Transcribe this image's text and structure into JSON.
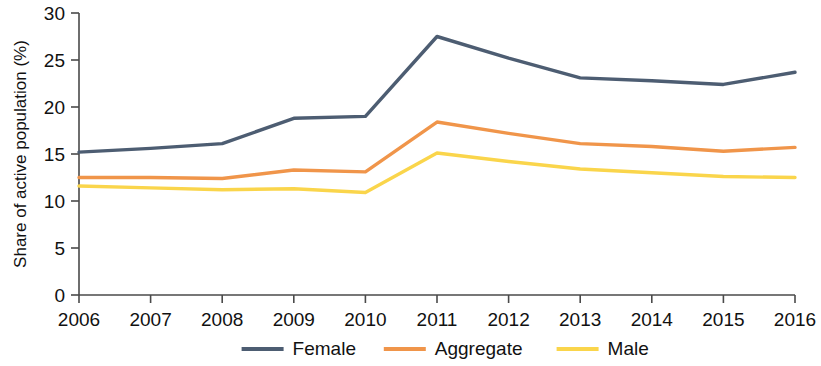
{
  "chart_data": {
    "type": "line",
    "title": "",
    "xlabel": "",
    "ylabel": "Share of active population (%)",
    "categories": [
      "2006",
      "2007",
      "2008",
      "2009",
      "2010",
      "2011",
      "2012",
      "2013",
      "2014",
      "2015",
      "2016"
    ],
    "x": [
      2006,
      2007,
      2008,
      2009,
      2010,
      2011,
      2012,
      2013,
      2014,
      2015,
      2016
    ],
    "xlim": [
      2006,
      2016
    ],
    "ylim": [
      0,
      30
    ],
    "yticks": [
      0,
      5,
      10,
      15,
      20,
      25,
      30
    ],
    "grid": false,
    "legend_position": "bottom",
    "series": [
      {
        "name": "Female",
        "color": "#4d5d72",
        "values": [
          15.2,
          15.6,
          16.1,
          18.8,
          19.0,
          27.5,
          25.2,
          23.1,
          22.8,
          22.4,
          23.7
        ]
      },
      {
        "name": "Aggregate",
        "color": "#f0954a",
        "values": [
          12.5,
          12.5,
          12.4,
          13.3,
          13.1,
          18.4,
          17.2,
          16.1,
          15.8,
          15.3,
          15.7
        ]
      },
      {
        "name": "Male",
        "color": "#fad54b",
        "values": [
          11.6,
          11.4,
          11.2,
          11.3,
          10.9,
          15.1,
          14.2,
          13.4,
          13.0,
          12.6,
          12.5
        ]
      }
    ]
  },
  "axes": {
    "y_axis_label": "Share of active population (%)",
    "y_tick_labels": [
      "0",
      "5",
      "10",
      "15",
      "20",
      "25",
      "30"
    ],
    "x_tick_labels": [
      "2006",
      "2007",
      "2008",
      "2009",
      "2010",
      "2011",
      "2012",
      "2013",
      "2014",
      "2015",
      "2016"
    ]
  },
  "legend": {
    "items": [
      {
        "label": "Female",
        "color": "#4d5d72"
      },
      {
        "label": "Aggregate",
        "color": "#f0954a"
      },
      {
        "label": "Male",
        "color": "#fad54b"
      }
    ]
  },
  "colors": {
    "female": "#4d5d72",
    "aggregate": "#f0954a",
    "male": "#fad54b",
    "axis": "#4a4a4a",
    "text": "#111111",
    "background": "#ffffff"
  }
}
